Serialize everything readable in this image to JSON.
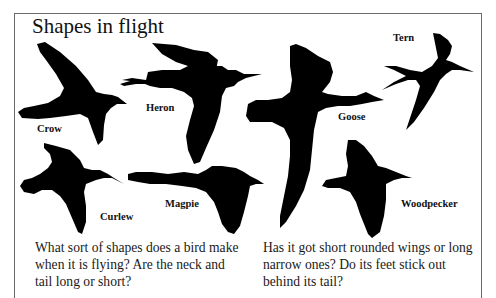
{
  "page": {
    "title": "Shapes in flight",
    "birds": [
      {
        "name": "crow",
        "label": "Crow"
      },
      {
        "name": "heron",
        "label": "Heron"
      },
      {
        "name": "goose",
        "label": "Goose"
      },
      {
        "name": "tern",
        "label": "Tern"
      },
      {
        "name": "curlew",
        "label": "Curlew"
      },
      {
        "name": "magpie",
        "label": "Magpie"
      },
      {
        "name": "woodpecker",
        "label": "Woodpecker"
      }
    ],
    "paragraphs": {
      "left": "What sort of shapes does a bird make when it is flying? Are the neck and tail long or short?",
      "right": "Has it got short rounded wings or long narrow ones? Do its feet stick out behind its tail?"
    },
    "colors": {
      "silhouette": "#000000",
      "background": "#ffffff",
      "frame": "#6a6a6a"
    }
  }
}
